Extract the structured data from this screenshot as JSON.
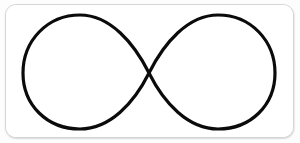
{
  "canvas": {
    "width": 300,
    "height": 143,
    "background_color": "#fdfdfd"
  },
  "card": {
    "name": "rounded-card-frame",
    "x": 5,
    "y": 4,
    "width": 289,
    "height": 134,
    "corner_radius": 11,
    "background_color": "#ffffff",
    "border_color": "#d6d6d6",
    "border_width": 1,
    "shadow_color": "rgba(0,0,0,0.10)"
  },
  "figure": {
    "name": "infinity-symbol",
    "glyph": "∞",
    "label": "Infinity symbol (lemniscate)",
    "stroke_color": "#0b0b0b",
    "stroke_width": 3.2,
    "fill": "none",
    "geometry": {
      "crossing_point": {
        "x": 143,
        "y": 68
      },
      "left_lobe": {
        "center_x": 74,
        "center_y": 68,
        "radius_x": 69,
        "radius_y": 58
      },
      "right_lobe": {
        "center_x": 212,
        "center_y": 68,
        "radius_x": 69,
        "radius_y": 58
      },
      "bounds": {
        "left": 17,
        "top": 10,
        "right": 273,
        "bottom": 124
      }
    },
    "path_d": "M 143 68 C 128 38, 104 10, 74 10 C 41 10, 17 36, 17 68 C 17 100, 41 124, 74 124 C 104 124, 128 98, 143 68 C 158 38, 182 10, 212 10 C 245 10, 269 36, 269 68 C 269 100, 245 124, 212 124 C 182 124, 158 98, 143 68 Z"
  }
}
